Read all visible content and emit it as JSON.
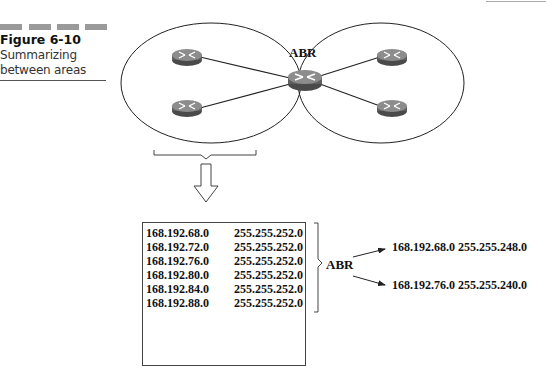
{
  "figure": {
    "number": "Figure 6-10",
    "caption_line1": "Summarizing",
    "caption_line2": "between areas"
  },
  "diagram": {
    "abr_label": "ABR",
    "areas": [
      {
        "name": "left-area",
        "routers": 2
      },
      {
        "name": "right-area",
        "routers": 2
      }
    ],
    "colors": {
      "router_body": "#6b6b6b",
      "router_top": "#8a8a8a",
      "line": "#222222"
    }
  },
  "routes_table": {
    "rows": [
      {
        "network": "168.192.68.0",
        "mask": "255.255.252.0"
      },
      {
        "network": "168.192.72.0",
        "mask": "255.255.252.0"
      },
      {
        "network": "168.192.76.0",
        "mask": "255.255.252.0"
      },
      {
        "network": "168.192.80.0",
        "mask": "255.255.252.0"
      },
      {
        "network": "168.192.84.0",
        "mask": "255.255.252.0"
      },
      {
        "network": "168.192.88.0",
        "mask": "255.255.252.0"
      }
    ],
    "bracket_label": "ABR"
  },
  "summaries": [
    {
      "network": "168.192.68.0",
      "mask": "255.255.248.0"
    },
    {
      "network": "168.192.76.0",
      "mask": "255.255.240.0"
    }
  ]
}
